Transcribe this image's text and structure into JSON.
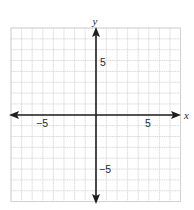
{
  "chart_data": {
    "type": "coordinate-plane",
    "title": "",
    "xlabel": "x",
    "ylabel": "y",
    "xlim": [
      -8,
      8
    ],
    "ylim": [
      -8,
      8
    ],
    "grid": true,
    "grid_step": 1,
    "x_tick_labels": [
      {
        "value": -5,
        "label": "−5"
      },
      {
        "value": 5,
        "label": "5"
      }
    ],
    "y_tick_labels": [
      {
        "value": 5,
        "label": "5"
      },
      {
        "value": -5,
        "label": "−5"
      }
    ],
    "axes_arrows": true,
    "series": []
  },
  "labels": {
    "x_axis": "x",
    "y_axis": "y",
    "x_neg5": "−5",
    "x_pos5": "5",
    "y_pos5": "5",
    "y_neg5": "−5"
  },
  "colors": {
    "grid": "#cfcfcf",
    "axis": "#1e1e1e",
    "text": "#2a2a2a",
    "background": "#ffffff"
  }
}
